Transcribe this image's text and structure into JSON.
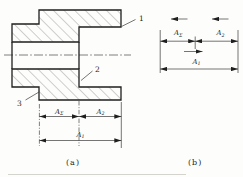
{
  "colors": {
    "paper": "#fdfdfb",
    "ink": "#1f1f1f",
    "thin": "#3a3a3a",
    "hatch": "#6e6e6e",
    "faint": "#c9c9c3"
  },
  "labels": {
    "callout_1": "1",
    "callout_2": "2",
    "callout_3": "3",
    "dim_base": "A",
    "sub_sigma": "Σ",
    "sub_two": "2",
    "sub_one": "1",
    "caption_a": "(a)",
    "caption_b": "(b)"
  }
}
